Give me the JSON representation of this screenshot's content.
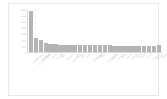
{
  "chart_data": {
    "type": "bar",
    "title": "",
    "xlabel": "",
    "ylabel": "",
    "ylim": [
      0,
      3500
    ],
    "grid": false,
    "legend": null,
    "bar_color": "#b4b4b4",
    "axis_color": "#d9d9d9",
    "tick_label_color": "#bbbbbb",
    "yticks": [
      0,
      500,
      1000,
      1500,
      2000,
      2500,
      3000,
      3500
    ],
    "ytick_labels": [
      "0",
      "500",
      "1000",
      "1500",
      "2000",
      "2500",
      "3000",
      "3500"
    ],
    "categories": [
      "United States",
      "United Kingdom",
      "Germany",
      "China",
      "France",
      "Canada",
      "Japan",
      "Australia",
      "Netherlands",
      "Italy",
      "Spain",
      "India",
      "Switzerland",
      "Sweden",
      "Brazil",
      "South Korea",
      "Belgium",
      "Denmark",
      "Russia",
      "Austria",
      "Norway",
      "Poland",
      "Israel",
      "Finland",
      "Singapore",
      "Portugal",
      "Ireland"
    ],
    "values": [
      3420,
      1180,
      980,
      760,
      700,
      660,
      620,
      600,
      590,
      580,
      575,
      565,
      560,
      555,
      550,
      545,
      545,
      540,
      540,
      535,
      535,
      530,
      530,
      525,
      525,
      520,
      560
    ]
  }
}
